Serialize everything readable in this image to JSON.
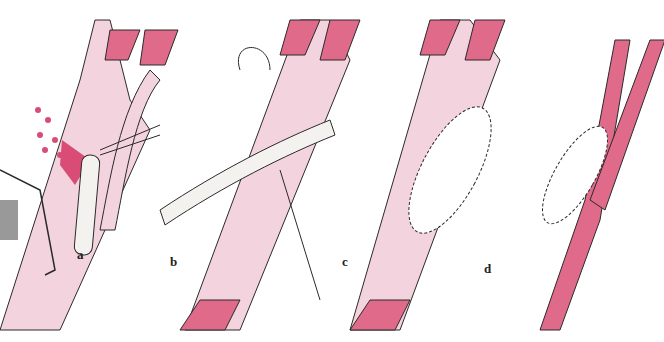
{
  "figure": {
    "type": "surgical-illustration",
    "panels": [
      {
        "id": "a",
        "label": "a"
      },
      {
        "id": "b",
        "label": "b"
      },
      {
        "id": "c",
        "label": "c"
      },
      {
        "id": "d",
        "label": "d"
      }
    ],
    "colors": {
      "vessel_pink": "#e06a8a",
      "vessel_light": "#f3d3de",
      "blood": "#d94c76",
      "outline": "#2a2a2a",
      "shunt": "#f4f2ee"
    }
  }
}
